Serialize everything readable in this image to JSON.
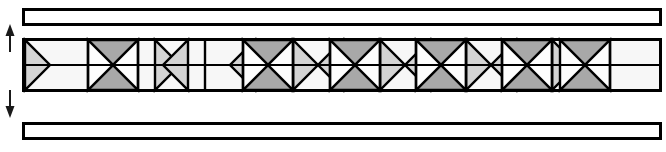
{
  "figure": {
    "name": "lattice-truss-beam-elevation",
    "width": 666,
    "height": 152,
    "background": "#ffffff"
  },
  "colors": {
    "stroke": "#000000",
    "flange_fill": "#ffffff",
    "chord_fill": "#f7f7f7",
    "wedge_light": "#d4d4d4",
    "wedge_dark": "#a8a8a8",
    "web_white": "#fdfdfd",
    "arrow": "#1a1a1a"
  },
  "top_flange": {
    "label": "top-flange-bar",
    "x": 22,
    "y": 8,
    "width": 640,
    "height": 18,
    "stroke_width": 3
  },
  "bottom_flange": {
    "label": "bottom-flange-bar",
    "x": 22,
    "y": 122,
    "width": 640,
    "height": 18,
    "stroke_width": 3
  },
  "web_band": {
    "label": "lattice-web-band",
    "x": 22,
    "y": 38,
    "width": 640,
    "height": 54,
    "stroke_width": 3,
    "midline_y": 65
  },
  "depth_arrows": {
    "label": "beam-depth-dimension",
    "x": 10,
    "top_y": 30,
    "bottom_y": 112,
    "up_arrow": "arrow-up",
    "down_arrow": "arrow-down"
  },
  "lattice": {
    "note": "alternating X-braced square cells and triangular wedge nodes along the web",
    "cell_top": 40,
    "cell_bottom": 90,
    "mid_y": 65,
    "x_cells": [
      {
        "x0": 88,
        "x1": 138,
        "top_fill": "wedge_dark",
        "bottom_fill": "wedge_dark",
        "left_fill": "web_white",
        "right_fill": "web_white"
      },
      {
        "x0": 243,
        "x1": 293,
        "top_fill": "wedge_dark",
        "bottom_fill": "wedge_dark",
        "left_fill": "web_white",
        "right_fill": "web_white"
      },
      {
        "x0": 330,
        "x1": 380,
        "top_fill": "wedge_dark",
        "bottom_fill": "wedge_dark",
        "left_fill": "web_white",
        "right_fill": "web_white"
      },
      {
        "x0": 416,
        "x1": 466,
        "top_fill": "wedge_dark",
        "bottom_fill": "wedge_dark",
        "left_fill": "web_white",
        "right_fill": "web_white"
      },
      {
        "x0": 502,
        "x1": 552,
        "top_fill": "wedge_dark",
        "bottom_fill": "wedge_dark",
        "left_fill": "web_white",
        "right_fill": "web_white"
      },
      {
        "x0": 560,
        "x1": 610,
        "top_fill": "wedge_dark",
        "bottom_fill": "wedge_dark",
        "left_fill": "web_white",
        "right_fill": "web_white"
      }
    ],
    "right_wedges": [
      {
        "x0": 25,
        "x1": 75,
        "fill": "wedge_light"
      },
      {
        "x0": 155,
        "x1": 205,
        "fill": "wedge_light"
      },
      {
        "x0": 293,
        "x1": 343,
        "fill": "wedge_light"
      },
      {
        "x0": 380,
        "x1": 430,
        "fill": "wedge_light"
      },
      {
        "x0": 466,
        "x1": 516,
        "fill": "wedge_light"
      },
      {
        "x0": 552,
        "x1": 602,
        "fill": "wedge_light"
      }
    ],
    "left_wedges": [
      {
        "x0": 138,
        "x1": 188,
        "fill": "wedge_light"
      },
      {
        "x0": 205,
        "x1": 255,
        "fill": "wedge_light"
      },
      {
        "x0": 293,
        "x1": 343,
        "fill": "wedge_light"
      },
      {
        "x0": 380,
        "x1": 430,
        "fill": "wedge_light"
      },
      {
        "x0": 466,
        "x1": 516,
        "fill": "wedge_light"
      }
    ],
    "dividers": [
      88,
      138,
      205,
      243,
      293,
      330,
      380,
      416,
      466,
      502,
      552,
      610
    ]
  }
}
